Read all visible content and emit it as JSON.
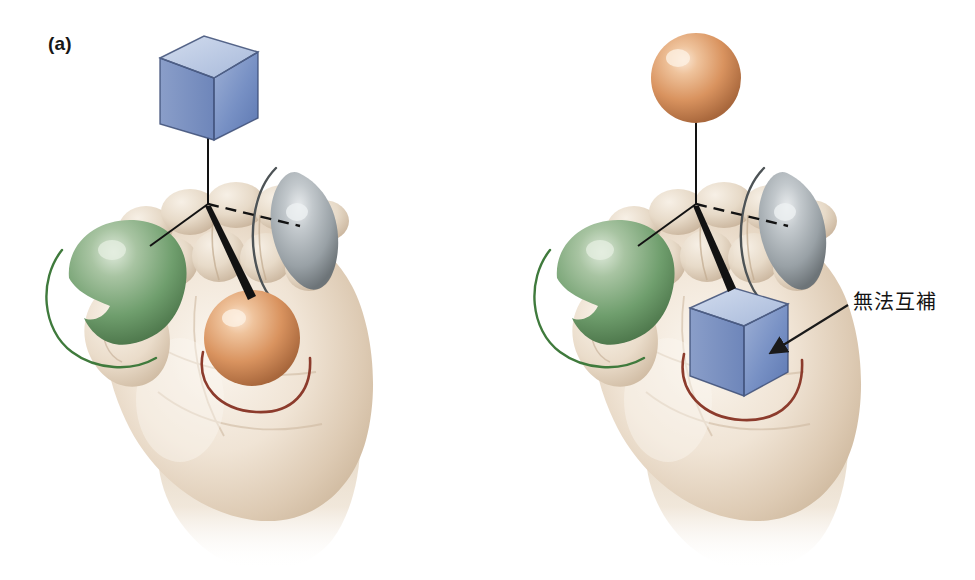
{
  "figure": {
    "type": "scientific-illustration",
    "background_color": "#ffffff",
    "width": 975,
    "height": 580
  },
  "panels": [
    {
      "id": "a",
      "label": "(a)",
      "held_object": {
        "name": "orange-sphere",
        "shape": "sphere",
        "color": "#d9935f",
        "highlight_color": "#f6ddc6",
        "location": "palm"
      },
      "floating_object": {
        "name": "blue-cube",
        "shape": "cube",
        "color": "#6a84bd",
        "top_face_color": "#b8c6e2",
        "left_face_color": "#8fa3cc",
        "location": "above-hand"
      },
      "complementary": true
    },
    {
      "id": "b",
      "label": "(b)",
      "held_object": {
        "name": "blue-cube",
        "shape": "cube",
        "color": "#6a84bd",
        "top_face_color": "#b8c6e2",
        "left_face_color": "#8fa3cc",
        "location": "palm"
      },
      "floating_object": {
        "name": "orange-sphere",
        "shape": "sphere",
        "color": "#d9935f",
        "highlight_color": "#f6ddc6",
        "location": "above-hand"
      },
      "complementary": false
    }
  ],
  "binding_site_features": [
    {
      "name": "green-dome",
      "shape": "dome",
      "color": "#6f9e6d",
      "arc_color": "#3f7a3c",
      "position": "thumb-left"
    },
    {
      "name": "gray-lens",
      "shape": "lens",
      "color": "#99a1a6",
      "arc_color": "#4d5356",
      "position": "index-right"
    },
    {
      "name": "red-arc",
      "shape": "arc",
      "color": "#8c3b2c",
      "position": "palm-base"
    }
  ],
  "connectors": {
    "vertical_line_style": "solid",
    "green_line_style": "solid-thin",
    "gray_line_style": "dashed",
    "palm_line_style": "solid-thick-wedge",
    "color": "#121212"
  },
  "annotation": {
    "text": "無法互補",
    "meaning_note": "cannot complement",
    "arrow": {
      "name": "callout-arrow",
      "color": "#1a1a1a",
      "from": "text-label",
      "to": "blue-cube-in-palm"
    }
  },
  "hand": {
    "name": "cupped-hand",
    "view": "palm",
    "skin_light": "#f4ece2",
    "skin_mid": "#e3d5c3",
    "skin_shadow": "#c9b49c"
  }
}
